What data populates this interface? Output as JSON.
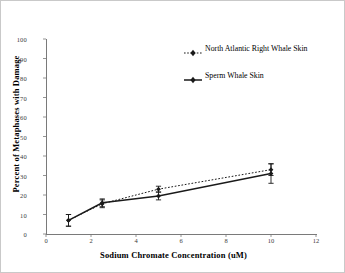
{
  "chart_data": {
    "type": "line",
    "title": "",
    "xlabel": "Sodium Chromate Concentration (uM)",
    "ylabel": "Percent of Metaphases with Damage",
    "xlim": [
      0,
      12
    ],
    "ylim": [
      0,
      100
    ],
    "xticks": [
      0,
      2,
      4,
      6,
      8,
      10,
      12
    ],
    "yticks": [
      0,
      10,
      20,
      30,
      40,
      50,
      60,
      70,
      80,
      90,
      100
    ],
    "grid": false,
    "legend_position": "upper-right-inside",
    "x": [
      1,
      2.5,
      5,
      10
    ],
    "series": [
      {
        "name": "North Atlantic Right Whale Skin",
        "values": [
          7,
          15.5,
          23,
          33
        ],
        "errors": [
          3,
          2,
          1.5,
          3
        ],
        "linestyle": "dotted",
        "marker": "diamond",
        "color": "#1a1a1a"
      },
      {
        "name": "Sperm Whale Skin",
        "values": [
          7,
          16,
          19.5,
          31
        ],
        "errors": [
          3,
          2,
          2,
          5
        ],
        "linestyle": "solid",
        "marker": "diamond",
        "color": "#1a1a1a"
      }
    ]
  },
  "legend": {
    "items": [
      {
        "label": "North Atlantic Right Whale Skin",
        "key": "dotted-diamond-key"
      },
      {
        "label": "Sperm Whale Skin",
        "key": "solid-diamond-key"
      }
    ]
  },
  "axes": {
    "x_tick_labels": [
      "0",
      "2",
      "4",
      "6",
      "8",
      "10",
      "12"
    ],
    "y_tick_labels": [
      "0",
      "10",
      "20",
      "30",
      "40",
      "50",
      "60",
      "70",
      "80",
      "90",
      "100"
    ],
    "x_title": "Sodium Chromate Concentration (uM)",
    "y_title": "Percent of Metaphases with Damage"
  },
  "style": {
    "axis_color": "#7a7a7a",
    "data_color": "#1a1a1a",
    "background": "#ffffff",
    "border_color": "#c9c9c9"
  }
}
